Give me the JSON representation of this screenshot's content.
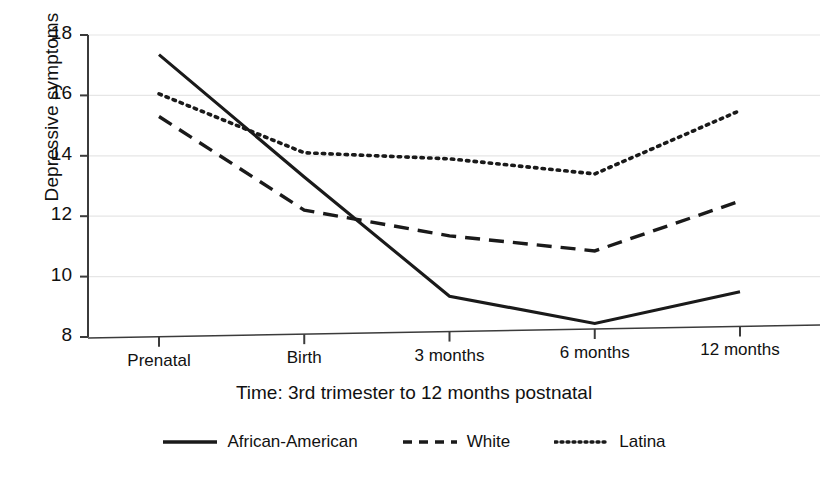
{
  "chart_data": {
    "type": "line",
    "title": "",
    "xlabel": "Time: 3rd trimester to 12 months postnatal",
    "ylabel": "Depressive symptoms",
    "categories": [
      "Prenatal",
      "Birth",
      "3 months",
      "6 months",
      "12 months"
    ],
    "ylim": [
      8,
      18
    ],
    "yticks": [
      8,
      10,
      12,
      14,
      16,
      18
    ],
    "ytick_labels": [
      "8",
      "10",
      "12",
      "14",
      "16",
      "18"
    ],
    "grid": true,
    "legend_position": "bottom",
    "series": [
      {
        "name": "African-American",
        "style": "solid",
        "color": "#1a1a1a",
        "values": [
          17.35,
          13.3,
          9.35,
          8.45,
          9.5
        ]
      },
      {
        "name": "White",
        "style": "dashed",
        "color": "#1a1a1a",
        "values": [
          15.3,
          12.2,
          11.35,
          10.85,
          12.5
        ]
      },
      {
        "name": "Latina",
        "style": "dotted",
        "color": "#1a1a1a",
        "values": [
          16.05,
          14.1,
          13.9,
          13.4,
          15.5
        ]
      }
    ]
  },
  "axes": {
    "y_title": "Depressive symptoms",
    "x_title": "Time: 3rd trimester to 12 months postnatal"
  },
  "legend": {
    "items": [
      {
        "label": "African-American",
        "style": "solid"
      },
      {
        "label": "White",
        "style": "dashed"
      },
      {
        "label": "Latina",
        "style": "dotted"
      }
    ]
  }
}
